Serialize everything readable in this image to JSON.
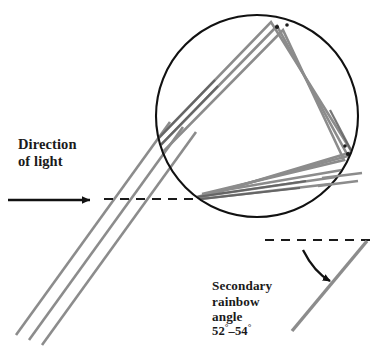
{
  "figure": {
    "background_color": "#ffffff"
  },
  "labels": {
    "direction_of_light": "Direction\nof light",
    "secondary_rainbow_angle": "Secondary\nrainbow\nangle",
    "angle_range": "52°–54°",
    "angle_min": "52",
    "angle_max": "54",
    "degree_symbol": "°"
  },
  "colors": {
    "ray": "#8c8c8c",
    "ray_dark": "#6f6f6f",
    "outline": "#111111",
    "dashed": "#1a1a1a",
    "text": "#1a1a1a",
    "background": "#ffffff"
  },
  "geometry": {
    "droplet": {
      "cx": 257,
      "cy": 116,
      "r": 101,
      "stroke_width": 2.1
    },
    "entry_point": {
      "x": 164,
      "y": 131
    },
    "vertex_top": {
      "x": 277,
      "y": 26
    },
    "vertex_right": {
      "x": 348,
      "y": 156
    },
    "vertex_bottom": {
      "x": 199,
      "y": 196
    },
    "axis_dashed_left": {
      "x1": 104,
      "y1": 199,
      "x2": 200,
      "y2": 199
    },
    "axis_dashed_right": {
      "x1": 265,
      "y1": 240,
      "x2": 370,
      "y2": 240
    },
    "arrow_incoming": {
      "x1": 8,
      "y1": 200,
      "x2": 96,
      "y2": 200
    },
    "exit_ray": {
      "x1": 292,
      "y1": 330,
      "x2": 366,
      "y2": 241
    },
    "ray_offsets": [
      -4.2,
      0,
      4.2
    ],
    "ray_width": 2.6
  }
}
